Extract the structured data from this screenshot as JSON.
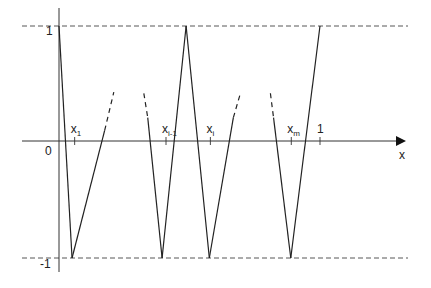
{
  "diagram": {
    "type": "zigzag-function-plot",
    "axis_labels": {
      "x": "x",
      "origin": "0"
    },
    "y_ticks": [
      {
        "value": 1,
        "label": "1"
      },
      {
        "value": -1,
        "label": "-1"
      }
    ],
    "x_ticks": [
      {
        "name": "x-1",
        "base": "x",
        "sub": "1",
        "value": 0.06
      },
      {
        "name": "x-i-minus-1",
        "base": "x",
        "sub": "i-1",
        "value": 0.41
      },
      {
        "name": "x-i",
        "base": "x",
        "sub": "i",
        "value": 0.58
      },
      {
        "name": "x-m",
        "base": "x",
        "sub": "m",
        "value": 0.89
      },
      {
        "name": "one",
        "base": "1",
        "sub": "",
        "value": 1.0
      }
    ],
    "reference_lines": [
      {
        "name": "y-equals-1",
        "value": 1,
        "style": "dashed"
      },
      {
        "name": "y-equals-minus-1",
        "value": -1,
        "style": "dashed"
      }
    ],
    "segments": [
      {
        "name": "seg-1",
        "style": "solid",
        "points": [
          [
            0.0,
            1
          ],
          [
            0.05,
            -1
          ]
        ]
      },
      {
        "name": "seg-2",
        "style": "solid",
        "points": [
          [
            0.05,
            -1
          ],
          [
            0.175,
            0.1
          ]
        ]
      },
      {
        "name": "seg-2-dash",
        "style": "dashed",
        "points": [
          [
            0.175,
            0.1
          ],
          [
            0.21,
            0.43
          ]
        ]
      },
      {
        "name": "seg-3-dash",
        "style": "dashed",
        "points": [
          [
            0.325,
            0.42
          ],
          [
            0.34,
            0.21
          ]
        ]
      },
      {
        "name": "seg-3",
        "style": "solid",
        "points": [
          [
            0.34,
            0.21
          ],
          [
            0.395,
            -1
          ]
        ]
      },
      {
        "name": "seg-4",
        "style": "solid",
        "points": [
          [
            0.395,
            -1
          ],
          [
            0.487,
            1
          ]
        ]
      },
      {
        "name": "seg-5",
        "style": "solid",
        "points": [
          [
            0.487,
            1
          ],
          [
            0.576,
            -1
          ]
        ]
      },
      {
        "name": "seg-6",
        "style": "solid",
        "points": [
          [
            0.576,
            -1
          ],
          [
            0.668,
            0.21
          ]
        ]
      },
      {
        "name": "seg-6-dash",
        "style": "dashed",
        "points": [
          [
            0.668,
            0.21
          ],
          [
            0.695,
            0.42
          ]
        ]
      },
      {
        "name": "seg-7-dash",
        "style": "dashed",
        "points": [
          [
            0.81,
            0.42
          ],
          [
            0.822,
            0.21
          ]
        ]
      },
      {
        "name": "seg-7",
        "style": "solid",
        "points": [
          [
            0.822,
            0.21
          ],
          [
            0.888,
            -1
          ]
        ]
      },
      {
        "name": "seg-8",
        "style": "solid",
        "points": [
          [
            0.888,
            -1
          ],
          [
            1.0,
            1
          ]
        ]
      }
    ]
  }
}
